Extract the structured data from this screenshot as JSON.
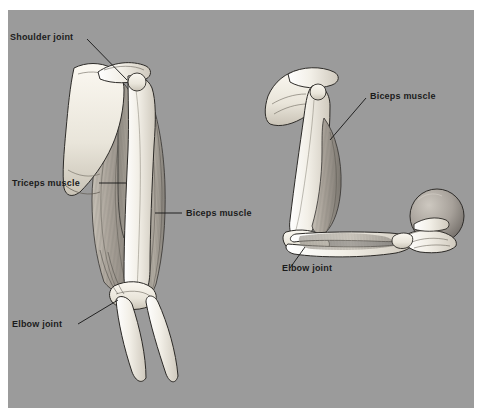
{
  "figure": {
    "panel_background_color": "#9b9b9b",
    "page_background_color": "#ffffff",
    "bone_color": "#efece4",
    "muscle_color": "#a9a39a",
    "outline_color": "#2b2b2b",
    "label_color": "#1b1b1b"
  },
  "labels": {
    "shoulder_joint": "Shoulder joint",
    "triceps_muscle": "Triceps muscle",
    "biceps_muscle_left": "Biceps muscle",
    "elbow_joint_left": "Elbow joint",
    "biceps_muscle_right": "Biceps muscle",
    "elbow_joint_right": "Elbow joint"
  },
  "structures": {
    "left_figure": {
      "pose": "extended arm, anterior view",
      "parts": [
        "scapula",
        "clavicle",
        "humerus",
        "biceps brachii",
        "triceps brachii",
        "radius",
        "ulna"
      ]
    },
    "right_figure": {
      "pose": "flexed arm holding ball",
      "parts": [
        "scapula",
        "clavicle",
        "humerus",
        "biceps brachii",
        "radius",
        "ulna",
        "hand",
        "ball"
      ]
    }
  }
}
